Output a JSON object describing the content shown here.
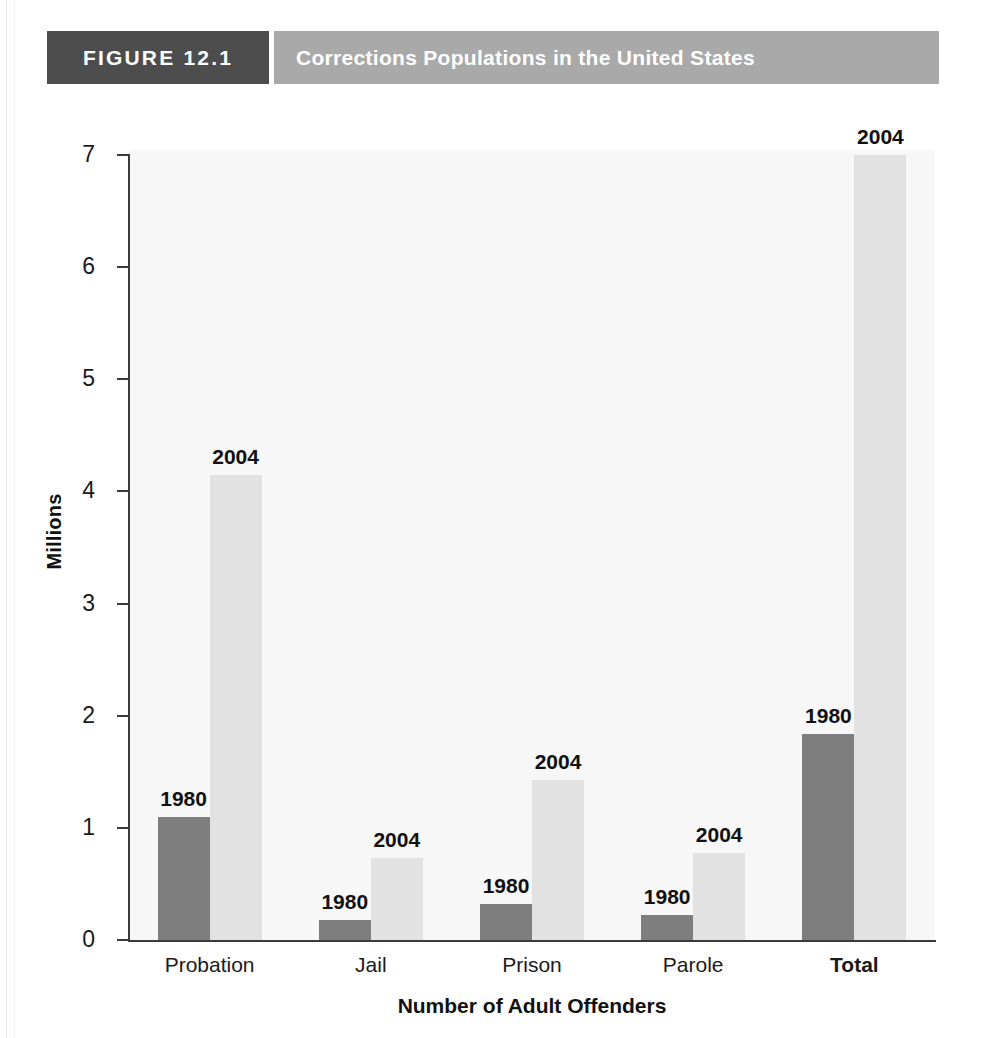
{
  "figure": {
    "tag": "FIGURE 12.1",
    "title": "Corrections Populations in the United States"
  },
  "chart_data": {
    "type": "bar",
    "title": "Corrections Populations in the United States",
    "xlabel": "Number of Adult Offenders",
    "ylabel": "Millions",
    "ylim": [
      0,
      7
    ],
    "yticks": [
      0,
      1,
      2,
      3,
      4,
      5,
      6,
      7
    ],
    "ytick_labels": [
      "0",
      "1",
      "2",
      "3",
      "4",
      "5",
      "6",
      "7"
    ],
    "grid": false,
    "legend": "none",
    "bar_value_labels": "series-year-above-bar",
    "categories": [
      "Probation",
      "Jail",
      "Prison",
      "Parole",
      "Total"
    ],
    "series": [
      {
        "name": "1980",
        "color": "#7e7e7e",
        "values": [
          1.1,
          0.18,
          0.32,
          0.22,
          1.84
        ]
      },
      {
        "name": "2004",
        "color": "#e2e2e2",
        "values": [
          4.15,
          0.73,
          1.43,
          0.78,
          7.0
        ]
      }
    ]
  },
  "axis": {
    "y_title": "Millions",
    "x_title": "Number of Adult Offenders",
    "ticks": [
      {
        "label": "7",
        "value": 7
      },
      {
        "label": "6",
        "value": 6
      },
      {
        "label": "5",
        "value": 5
      },
      {
        "label": "4",
        "value": 4
      },
      {
        "label": "3",
        "value": 3
      },
      {
        "label": "2",
        "value": 2
      },
      {
        "label": "1",
        "value": 1
      },
      {
        "label": "0",
        "value": 0
      }
    ]
  },
  "groups": [
    {
      "category": "Probation",
      "emphasis": false,
      "bars": [
        {
          "series": "1980",
          "label": "1980",
          "value": 1.1
        },
        {
          "series": "2004",
          "label": "2004",
          "value": 4.15
        }
      ]
    },
    {
      "category": "Jail",
      "emphasis": false,
      "bars": [
        {
          "series": "1980",
          "label": "1980",
          "value": 0.18
        },
        {
          "series": "2004",
          "label": "2004",
          "value": 0.73
        }
      ]
    },
    {
      "category": "Prison",
      "emphasis": false,
      "bars": [
        {
          "series": "1980",
          "label": "1980",
          "value": 0.32
        },
        {
          "series": "2004",
          "label": "2004",
          "value": 1.43
        }
      ]
    },
    {
      "category": "Parole",
      "emphasis": false,
      "bars": [
        {
          "series": "1980",
          "label": "1980",
          "value": 0.22
        },
        {
          "series": "2004",
          "label": "2004",
          "value": 0.78
        }
      ]
    },
    {
      "category": "Total",
      "emphasis": true,
      "bars": [
        {
          "series": "1980",
          "label": "1980",
          "value": 1.84
        },
        {
          "series": "2004",
          "label": "2004",
          "value": 7.0
        }
      ]
    }
  ],
  "colors": {
    "series_1980": "#7e7e7e",
    "series_2004": "#e2e2e2",
    "tag_bg": "#4d4d4d",
    "title_bg": "#a9a9a9",
    "axis": "#3b3b3b",
    "plot_bg": "#f7f7f7"
  }
}
